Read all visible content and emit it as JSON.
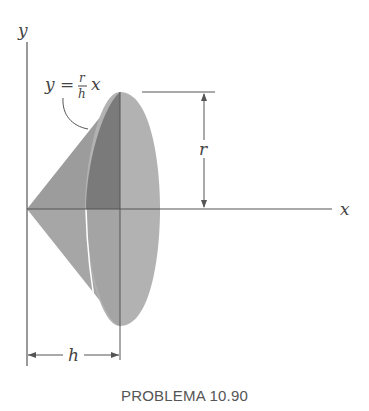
{
  "diagram": {
    "axis_labels": {
      "y": "y",
      "x": "x"
    },
    "curve_equation": {
      "lhs": "y",
      "equals": "=",
      "numerator": "r",
      "denominator": "h",
      "var": "x"
    },
    "dimensions": {
      "radius": "r",
      "height": "h"
    },
    "colors": {
      "cone_light": "#a8a8a8",
      "cone_mid": "#9a9a9a",
      "cone_dark": "#7c7c7c",
      "ellipse": "#b4b4b4",
      "line": "#555555"
    }
  },
  "caption": "PROBLEMA 10.90"
}
